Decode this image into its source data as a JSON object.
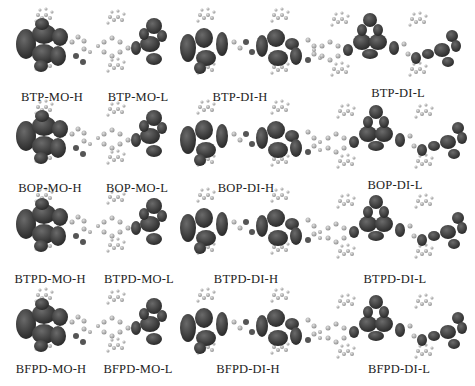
{
  "figure": {
    "rows": [
      {
        "family": "BTP",
        "labels": [
          "BTP-MO-H",
          "BTP-MO-L",
          "BTP-DI-H",
          "BTP-DI-L"
        ]
      },
      {
        "family": "BOP",
        "labels": [
          "BOP-MO-H",
          "BOP-MO-L",
          "BOP-DI-H",
          "BOP-DI-L"
        ]
      },
      {
        "family": "BTPD",
        "labels": [
          "BTPD-MO-H",
          "BTPD-MO-L",
          "BTPD-DI-H",
          "BTPD-DI-L"
        ]
      },
      {
        "family": "BFPD",
        "labels": [
          "BFPD-MO-H",
          "BFPD-MO-L",
          "BFPD-DI-H",
          "BFPD-DI-L"
        ]
      }
    ],
    "colors": {
      "lobe": "#3a3a3a",
      "atom": "#9a9a9a",
      "label": "#222222",
      "background": "#ffffff"
    }
  }
}
